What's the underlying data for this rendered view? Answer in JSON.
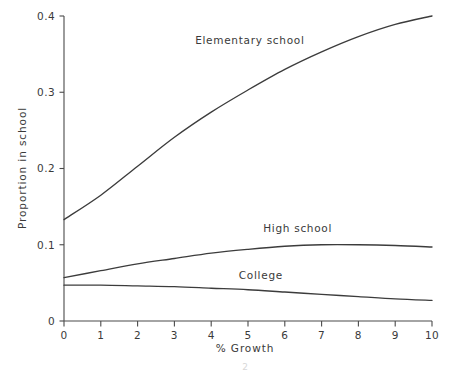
{
  "figure": {
    "background_color": "#ffffff",
    "ink_color": "#3c3c3c",
    "width": 460,
    "height": 372
  },
  "chart_data": {
    "type": "line",
    "title": "",
    "subtitle": "",
    "xlabel": "% Growth",
    "ylabel": "Proportion in school",
    "xlim": [
      0,
      10
    ],
    "ylim": [
      0,
      0.4
    ],
    "grid": false,
    "legend_position": "inline-labels",
    "x_ticks": [
      0,
      1,
      2,
      3,
      4,
      5,
      6,
      7,
      8,
      9,
      10
    ],
    "x_tick_labels": [
      "0",
      "1",
      "2",
      "3",
      "4",
      "5",
      "6",
      "7",
      "8",
      "9",
      "10"
    ],
    "y_ticks": [
      0,
      0.1,
      0.2,
      0.3,
      0.4
    ],
    "y_tick_labels": [
      "0",
      "0.1",
      "0.2",
      "0.3",
      "0.4"
    ],
    "x": [
      0,
      1,
      2,
      3,
      4,
      5,
      6,
      7,
      8,
      9,
      10
    ],
    "series": [
      {
        "name": "Elementary school",
        "label": "Elementary school",
        "values": [
          0.133,
          0.165,
          0.203,
          0.241,
          0.274,
          0.303,
          0.33,
          0.353,
          0.373,
          0.389,
          0.4
        ],
        "label_x": 5.05,
        "label_y": 0.368
      },
      {
        "name": "High school",
        "label": "High school",
        "values": [
          0.057,
          0.066,
          0.075,
          0.082,
          0.089,
          0.094,
          0.098,
          0.1,
          0.1,
          0.099,
          0.097
        ],
        "label_x": 6.35,
        "label_y": 0.122
      },
      {
        "name": "College",
        "label": "College",
        "values": [
          0.047,
          0.047,
          0.046,
          0.045,
          0.043,
          0.041,
          0.038,
          0.035,
          0.032,
          0.029,
          0.027
        ],
        "label_x": 5.35,
        "label_y": 0.06
      }
    ]
  },
  "annotations": {
    "page_artifact": "2"
  }
}
